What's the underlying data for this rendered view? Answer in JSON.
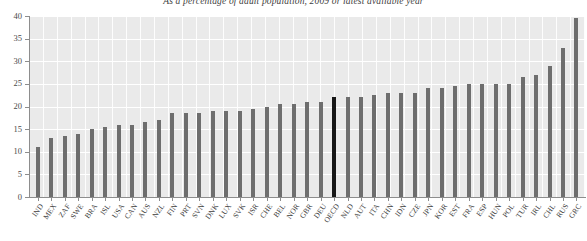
{
  "chart_data": {
    "type": "bar",
    "title": "As a percentage of adult population, 2009 or latest available year",
    "xlabel": "",
    "ylabel": "",
    "ylim": [
      0,
      40
    ],
    "yticks": [
      0,
      5,
      10,
      15,
      20,
      25,
      30,
      35,
      40
    ],
    "ytick_labels": [
      "0",
      "5",
      "10",
      "15",
      "20",
      "25",
      "30",
      "35",
      "40"
    ],
    "grid": true,
    "legend": "none",
    "highlight_category": "OECD",
    "bar_color": "#6e6e6e",
    "highlight_color": "#171717",
    "plot_background": "#eaeaea",
    "categories": [
      "IND",
      "MEX",
      "ZAF",
      "SWE",
      "BRA",
      "ISL",
      "USA",
      "CAN",
      "AUS",
      "NZL",
      "FIN",
      "PRT",
      "SVN",
      "DNK",
      "LUX",
      "SVK",
      "ISR",
      "CHE",
      "BEL",
      "NOR",
      "GBR",
      "DEU",
      "OECD",
      "NLD",
      "AUT",
      "ITA",
      "CHN",
      "IDN",
      "CZE",
      "JPN",
      "KOR",
      "EST",
      "FRA",
      "ESP",
      "HUN",
      "POL",
      "TUR",
      "IRL",
      "CHL",
      "RUS",
      "GRC"
    ],
    "values": [
      11,
      13,
      13.5,
      14,
      15,
      15.5,
      16,
      16,
      16.5,
      17,
      18.5,
      18.5,
      18.5,
      19,
      19,
      19,
      19.5,
      20,
      20.5,
      20.5,
      21,
      21,
      22,
      22,
      22,
      22.5,
      23,
      23,
      23,
      24,
      24,
      24.5,
      25,
      25,
      25,
      25,
      26.5,
      27,
      29,
      33,
      39.5
    ]
  }
}
